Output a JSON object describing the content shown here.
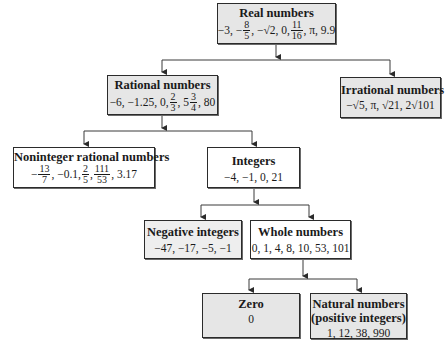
{
  "diagram": {
    "type": "tree",
    "nodes": {
      "real": {
        "title": "Real numbers",
        "values": {
          "a": "−3, −",
          "f1n": "8",
          "f1d": "5",
          "b": ", −√2, 0, ",
          "f2n": "11",
          "f2d": "16",
          "c": ", π, 9.9"
        }
      },
      "rational": {
        "title": "Rational numbers",
        "values": {
          "a": "−6, −1.25, 0, ",
          "f1n": "2",
          "f1d": "3",
          "b": ", 5",
          "f2n": "3",
          "f2d": "4",
          "c": ", 80"
        }
      },
      "irrational": {
        "title": "Irrational numbers",
        "values_text": "−√5, π, √21, 2√101"
      },
      "noninteger": {
        "title": "Noninteger rational numbers",
        "values": {
          "a": "−",
          "f1n": "13",
          "f1d": "7",
          "b": ", −0.1, ",
          "f2n": "2",
          "f2d": "5",
          "c": ", ",
          "f3n": "111",
          "f3d": "53",
          "d": ", 3.17"
        }
      },
      "integers": {
        "title": "Integers",
        "values_text": "−4, −1, 0, 21"
      },
      "negative": {
        "title": "Negative integers",
        "values_text": "−47, −17, −5, −1"
      },
      "whole": {
        "title": "Whole numbers",
        "values_text": "0, 1, 4, 8, 10, 53, 101"
      },
      "zero": {
        "title": "Zero",
        "values_text": "0"
      },
      "natural": {
        "title": "Natural numbers",
        "subtitle": "(positive integers)",
        "values_text": "1, 12, 38, 990"
      }
    },
    "edges": [
      [
        "real",
        "rational"
      ],
      [
        "real",
        "irrational"
      ],
      [
        "rational",
        "noninteger"
      ],
      [
        "rational",
        "integers"
      ],
      [
        "integers",
        "negative"
      ],
      [
        "integers",
        "whole"
      ],
      [
        "whole",
        "zero"
      ],
      [
        "whole",
        "natural"
      ]
    ],
    "colors": {
      "gray_fill": "#e6e6e6",
      "white_fill": "#ffffff",
      "border": "#2b2b2b",
      "line": "#3a3a3a"
    }
  }
}
